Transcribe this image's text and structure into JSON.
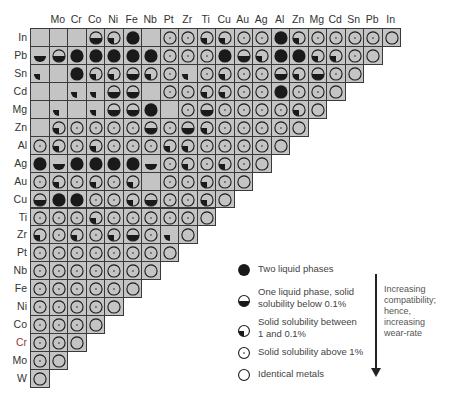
{
  "chart_data": {
    "type": "table",
    "title": "",
    "columns": [
      "W",
      "Mo",
      "Cr",
      "Co",
      "Ni",
      "Fe",
      "Nb",
      "Pt",
      "Zr",
      "Ti",
      "Cu",
      "Au",
      "Ag",
      "Al",
      "Zn",
      "Mg",
      "Cd",
      "Sn",
      "Pb",
      "In"
    ],
    "column_labels_shown": [
      "",
      "Mo",
      "Cr",
      "Co",
      "Ni",
      "Fe",
      "Nb",
      "Pt",
      "Zr",
      "Ti",
      "Cu",
      "Au",
      "Ag",
      "Al",
      "Zn",
      "Mg",
      "Cd",
      "Sn",
      "Pb",
      "In"
    ],
    "rows": [
      {
        "label": "In",
        "label_color": "#333333",
        "cells": [
          "E",
          "E",
          "E",
          "H",
          "Q",
          "F",
          "E",
          "D",
          "D",
          "Q",
          "Q",
          "D",
          "D",
          "F",
          "Q",
          "D",
          "D",
          "D",
          "D",
          "I"
        ]
      },
      {
        "label": "Pb",
        "label_color": "#333333",
        "cells": [
          "Hn",
          "H",
          "F",
          "F",
          "F",
          "F",
          "F",
          "D",
          "D",
          "D",
          "F",
          "H",
          "Q",
          "F",
          "F",
          "Q",
          "Q",
          "D",
          "I"
        ]
      },
      {
        "label": "Sn",
        "label_color": "#333333",
        "cells": [
          "Qn",
          "E",
          "F",
          "Q",
          "Q",
          "H",
          "Q",
          "D",
          "Qn",
          "D",
          "Q",
          "D",
          "D",
          "H",
          "Q",
          "H",
          "D",
          "I"
        ]
      },
      {
        "label": "Cd",
        "label_color": "#333333",
        "cells": [
          "E",
          "E",
          "Qn",
          "Qn",
          "H",
          "H",
          "E",
          "D",
          "D",
          "Q",
          "Q",
          "D",
          "D",
          "F",
          "D",
          "D",
          "I"
        ]
      },
      {
        "label": "Mg",
        "label_color": "#333333",
        "cells": [
          "E",
          "Qn",
          "E",
          "Qn",
          "H",
          "H",
          "F",
          "E",
          "D",
          "H",
          "D",
          "D",
          "D",
          "D",
          "Q",
          "I"
        ]
      },
      {
        "label": "Zn",
        "label_color": "#333333",
        "cells": [
          "E",
          "Q",
          "D",
          "D",
          "D",
          "D",
          "H",
          "D",
          "H",
          "Q",
          "D",
          "D",
          "D",
          "D",
          "I"
        ]
      },
      {
        "label": "Al",
        "label_color": "#333333",
        "cells": [
          "D",
          "Q",
          "D",
          "Q",
          "D",
          "D",
          "D",
          "Q",
          "Q",
          "D",
          "D",
          "D",
          "D",
          "I"
        ]
      },
      {
        "label": "Ag",
        "label_color": "#333333",
        "cells": [
          "F",
          "Hn",
          "F",
          "F",
          "F",
          "F",
          "Hn",
          "D",
          "Q",
          "D",
          "Q",
          "D",
          "I"
        ]
      },
      {
        "label": "Au",
        "label_color": "#333333",
        "cells": [
          "D",
          "Q",
          "D",
          "Q",
          "D",
          "Q",
          "E",
          "D",
          "D",
          "Q",
          "D",
          "I"
        ]
      },
      {
        "label": "Cu",
        "label_color": "#333333",
        "cells": [
          "H",
          "F",
          "F",
          "D",
          "D",
          "Q",
          "H",
          "D",
          "D",
          "Q",
          "I"
        ]
      },
      {
        "label": "Ti",
        "label_color": "#333333",
        "cells": [
          "D",
          "D",
          "D",
          "Q",
          "D",
          "D",
          "D",
          "D",
          "D",
          "I"
        ]
      },
      {
        "label": "Zr",
        "label_color": "#333333",
        "cells": [
          "Q",
          "D",
          "Q",
          "D",
          "Q",
          "H",
          "D",
          "Qn",
          "I"
        ]
      },
      {
        "label": "Pt",
        "label_color": "#333333",
        "cells": [
          "D",
          "D",
          "D",
          "D",
          "D",
          "D",
          "D",
          "I"
        ]
      },
      {
        "label": "Nb",
        "label_color": "#333333",
        "cells": [
          "D",
          "D",
          "D",
          "D",
          "D",
          "D",
          "I"
        ]
      },
      {
        "label": "Fe",
        "label_color": "#333333",
        "cells": [
          "D",
          "D",
          "D",
          "D",
          "D",
          "I"
        ]
      },
      {
        "label": "Ni",
        "label_color": "#333333",
        "cells": [
          "D",
          "D",
          "D",
          "D",
          "I"
        ]
      },
      {
        "label": "Co",
        "label_color": "#333333",
        "cells": [
          "D",
          "D",
          "D",
          "I"
        ]
      },
      {
        "label": "Cr",
        "label_color": "#9a3a3a",
        "cells": [
          "D",
          "D",
          "I"
        ]
      },
      {
        "label": "Mo",
        "label_color": "#333333",
        "cells": [
          "D",
          "I"
        ]
      },
      {
        "label": "W",
        "label_color": "#333333",
        "cells": [
          "I"
        ]
      }
    ],
    "symbol_codes": {
      "E": "empty (no data)",
      "F": "Two liquid phases",
      "H": "One liquid phase, solid solubility below 0.1%",
      "Q": "Solid solubility between 1 and 0.1%",
      "D": "Solid solubility above 1%",
      "I": "Identical metals",
      "n_suffix": "symbol drawn without outer circle"
    }
  },
  "legend": {
    "items": [
      {
        "symbol": "F",
        "label_lines": [
          "Two liquid phases"
        ]
      },
      {
        "symbol": "H",
        "label_lines": [
          "One liquid phase, solid",
          "solubility below 0.1%"
        ]
      },
      {
        "symbol": "Q",
        "label_lines": [
          "Solid solubility between",
          "1 and 0.1%"
        ]
      },
      {
        "symbol": "D",
        "label_lines": [
          "Solid solubility above 1%"
        ]
      },
      {
        "symbol": "I",
        "label_lines": [
          "Identical metals"
        ]
      }
    ]
  },
  "arrow_note": {
    "lines": [
      "Increasing",
      "compatibility;",
      "hence,",
      "increasing",
      "wear-rate"
    ]
  },
  "colors": {
    "cell_fill": "#c4c4c4",
    "grid_line": "#3a3a3a",
    "symbol": "#1a1a1a"
  }
}
